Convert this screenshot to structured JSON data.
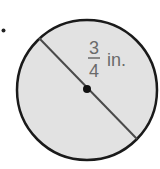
{
  "diagram": {
    "bullet": "•",
    "shape": "circle",
    "measurement": {
      "numerator": "3",
      "denominator": "4",
      "unit": "in.",
      "applies_to": "diameter"
    },
    "colors": {
      "fill": "#e2e2e2",
      "stroke": "#1a1a1a",
      "diameter_line": "#4a4a4a",
      "label": "#6a6a6a"
    }
  }
}
